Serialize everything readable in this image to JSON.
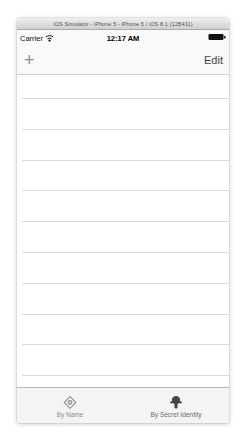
{
  "window": {
    "title": "iOS Simulator - iPhone 5 - iPhone 5 / iOS 8.1 (12B411)"
  },
  "status_bar": {
    "carrier": "Carrier",
    "wifi_icon": "wifi-icon",
    "time": "12:17 AM",
    "battery_icon": "battery-icon",
    "battery_state": "full"
  },
  "nav_bar": {
    "add_label": "+",
    "edit_label": "Edit"
  },
  "table": {
    "visible_rows": 10,
    "rows": [],
    "state": "empty"
  },
  "tab_bar": {
    "items": [
      {
        "label": "By Name",
        "icon": "diamond-emblem-icon",
        "selected": false
      },
      {
        "label": "By Secret Identity",
        "icon": "secret-identity-mask-icon",
        "selected": true
      }
    ]
  },
  "colors": {
    "titlebar_top": "#efefef",
    "titlebar_bottom": "#cfcfcf",
    "titlebar_text": "#555555",
    "bar_background": "#f9f9f9",
    "nav_border": "#cfcfcf",
    "add_button": "#8f8f8f",
    "edit_button": "#454545",
    "separator": "#dcdcdc",
    "tabbar_background": "#f4f4f4",
    "tabbar_border": "#b9b9b9",
    "tab_unselected": "#8e8e8e",
    "tab_selected": "#454545"
  }
}
